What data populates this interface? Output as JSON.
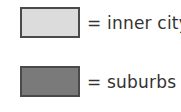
{
  "chart_data": {
    "type": "legend",
    "title": "",
    "legend": [
      {
        "label": "= inner city",
        "series": "inner city",
        "color": "#dcdcdc"
      },
      {
        "label": "= suburbs",
        "series": "suburbs",
        "color": "#7a7a7a"
      }
    ],
    "legend_position": "standalone"
  },
  "legend": {
    "items": [
      {
        "label": "= inner city",
        "color": "#dcdcdc"
      },
      {
        "label": "= suburbs",
        "color": "#7a7a7a"
      }
    ]
  }
}
